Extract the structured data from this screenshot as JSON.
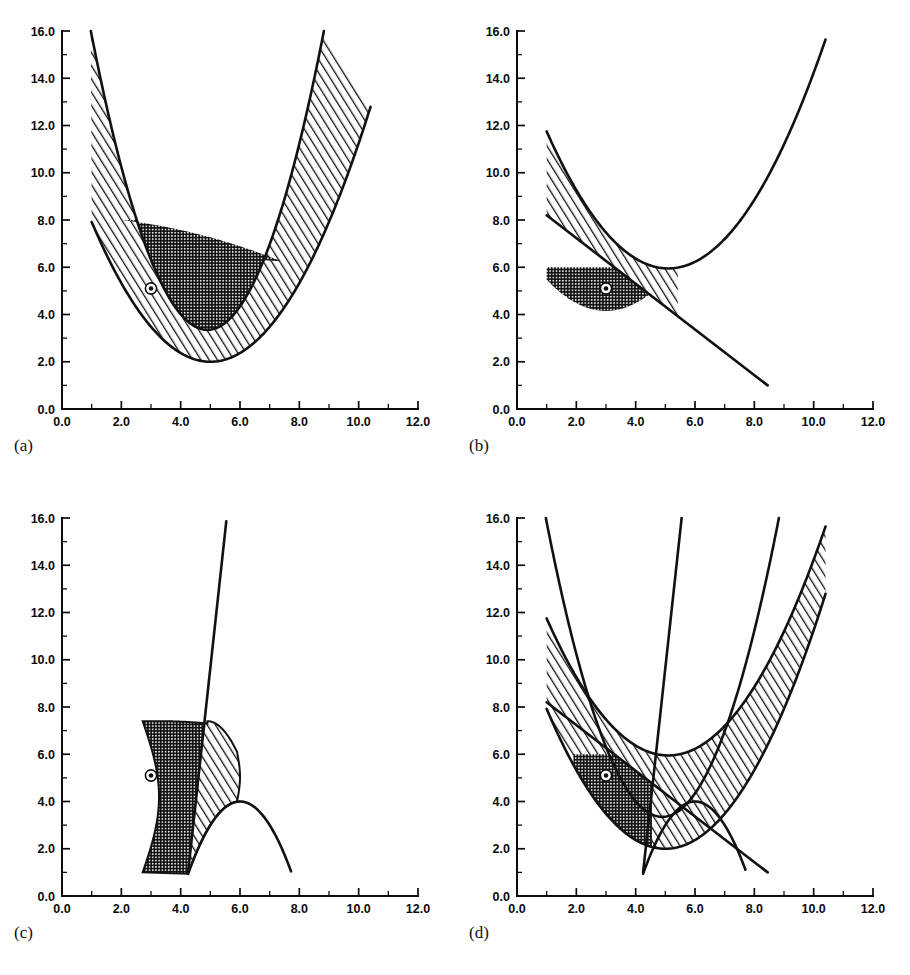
{
  "figure": {
    "panels": [
      {
        "id": "a",
        "caption": "(a)"
      },
      {
        "id": "b",
        "caption": "(b)"
      },
      {
        "id": "c",
        "caption": "(c)"
      },
      {
        "id": "d",
        "caption": "(d)"
      }
    ]
  },
  "axes": {
    "x_ticks": [
      "0.0",
      "2.0",
      "4.0",
      "6.0",
      "8.0",
      "10.0",
      "12.0"
    ],
    "y_ticks": [
      "0.0",
      "2.0",
      "4.0",
      "6.0",
      "8.0",
      "10.0",
      "12.0",
      "14.0",
      "16.0"
    ],
    "xlim": [
      0,
      12
    ],
    "ylim": [
      0,
      16
    ],
    "x_minor_step": 1.0,
    "y_minor_step": 1.0,
    "xlabel": "",
    "ylabel": ""
  },
  "marker": {
    "x": 3.0,
    "y": 5.1,
    "style": "bullseye"
  },
  "colors": {
    "ink": "#111111",
    "paper": "#ffffff",
    "dark_fill": "#3a3a3a",
    "hatch_fill": "#9a9a9a"
  },
  "chart_data": {
    "type": "line",
    "title": "",
    "xlabel": "",
    "ylabel": "",
    "xlim": [
      0,
      12
    ],
    "ylim": [
      0,
      16
    ],
    "grid": false,
    "legend": "none",
    "panels": [
      {
        "id": "a",
        "caption": "(a)",
        "curves": [
          {
            "name": "outer-parabola",
            "type": "parabola",
            "vertex": [
              5.0,
              2.0
            ],
            "a": 0.37,
            "x_range": [
              1.0,
              10.35
            ],
            "endpoints": [
              [
                1.0,
                10.0
              ],
              [
                10.35,
                16.0
              ]
            ]
          },
          {
            "name": "inner-parabola",
            "type": "parabola",
            "vertex": [
              4.9,
              3.35
            ],
            "a": 0.82,
            "x_range": [
              1.5,
              9.35
            ],
            "endpoints": [
              [
                1.5,
                16.0
              ],
              [
                9.35,
                16.0
              ]
            ]
          }
        ],
        "regions": [
          {
            "name": "hatched-outer",
            "fill": "diagonal-hatch",
            "between": [
              "outer-parabola",
              "dark-top-boundary"
            ]
          },
          {
            "name": "dark-inner",
            "fill": "cross-hatch",
            "top_level": 8.0,
            "min_level": 3.35
          }
        ],
        "marker": [
          3.0,
          5.1
        ]
      },
      {
        "id": "b",
        "caption": "(b)",
        "curves": [
          {
            "name": "rising-parabola",
            "type": "parabola",
            "vertex": [
              5.1,
              5.95
            ],
            "a": 0.345,
            "x_range": [
              1.0,
              10.4
            ],
            "endpoints": [
              [
                1.0,
                8.2
              ],
              [
                10.4,
                16.0
              ]
            ]
          },
          {
            "name": "falling-line",
            "type": "line",
            "points": [
              [
                1.0,
                8.2
              ],
              [
                8.45,
                1.0
              ]
            ],
            "slope": -0.966
          }
        ],
        "regions": [
          {
            "name": "hatched-outer",
            "fill": "diagonal-hatch",
            "x_range": [
              1.0,
              5.4
            ]
          },
          {
            "name": "dark-inner",
            "fill": "cross-hatch",
            "top_level": 6.0,
            "x_range": [
              1.0,
              5.0
            ],
            "min_level": 4.15
          }
        ],
        "marker": [
          3.0,
          5.1
        ]
      },
      {
        "id": "c",
        "caption": "(c)",
        "curves": [
          {
            "name": "steep-line",
            "type": "line",
            "points": [
              [
                4.25,
                1.0
              ],
              [
                5.55,
                16.0
              ]
            ],
            "slope": 11.5
          },
          {
            "name": "inverted-parabola",
            "type": "parabola",
            "vertex": [
              6.0,
              4.0
            ],
            "a": -1.0,
            "x_range": [
              4.25,
              7.7
            ],
            "endpoints": [
              [
                4.25,
                1.0
              ],
              [
                7.7,
                1.0
              ]
            ]
          }
        ],
        "regions": [
          {
            "name": "hatched-outer",
            "fill": "diagonal-hatch",
            "x_range": [
              4.3,
              5.9
            ],
            "top_level": 7.4
          },
          {
            "name": "dark-inner",
            "fill": "cross-hatch",
            "x_range": [
              2.7,
              4.8
            ],
            "top_level": 7.4,
            "base_level": 1.0
          }
        ],
        "marker": [
          3.0,
          5.1
        ]
      },
      {
        "id": "d",
        "caption": "(d)",
        "curves": [
          {
            "name": "outer-parabola",
            "type": "parabola",
            "vertex": [
              5.0,
              2.0
            ],
            "a": 0.37,
            "x_range": [
              1.0,
              10.4
            ],
            "endpoints": [
              [
                1.0,
                10.0
              ],
              [
                10.4,
                16.0
              ]
            ]
          },
          {
            "name": "inner-parabola",
            "type": "parabola",
            "vertex": [
              4.9,
              3.35
            ],
            "a": 0.82,
            "x_range": [
              1.5,
              9.35
            ],
            "endpoints": [
              [
                1.5,
                16.0
              ],
              [
                9.35,
                16.0
              ]
            ]
          },
          {
            "name": "rising-parabola",
            "type": "parabola",
            "vertex": [
              5.1,
              5.95
            ],
            "a": 0.345,
            "x_range": [
              1.0,
              10.4
            ],
            "endpoints": [
              [
                1.0,
                8.2
              ],
              [
                10.4,
                16.0
              ]
            ]
          },
          {
            "name": "falling-line",
            "type": "line",
            "points": [
              [
                1.0,
                8.2
              ],
              [
                8.45,
                1.0
              ]
            ]
          },
          {
            "name": "steep-line",
            "type": "line",
            "points": [
              [
                4.25,
                1.0
              ],
              [
                5.55,
                16.0
              ]
            ]
          },
          {
            "name": "inverted-parabola",
            "type": "parabola",
            "vertex": [
              6.0,
              4.0
            ],
            "a": -1.0,
            "x_range": [
              4.25,
              7.7
            ],
            "endpoints": [
              [
                4.25,
                1.0
              ],
              [
                7.7,
                1.0
              ]
            ]
          }
        ],
        "regions": [
          {
            "name": "hatched-outer",
            "fill": "diagonal-hatch"
          },
          {
            "name": "dark-inner",
            "fill": "cross-hatch",
            "top_level": 6.0
          }
        ],
        "marker": [
          3.0,
          5.1
        ]
      }
    ]
  }
}
